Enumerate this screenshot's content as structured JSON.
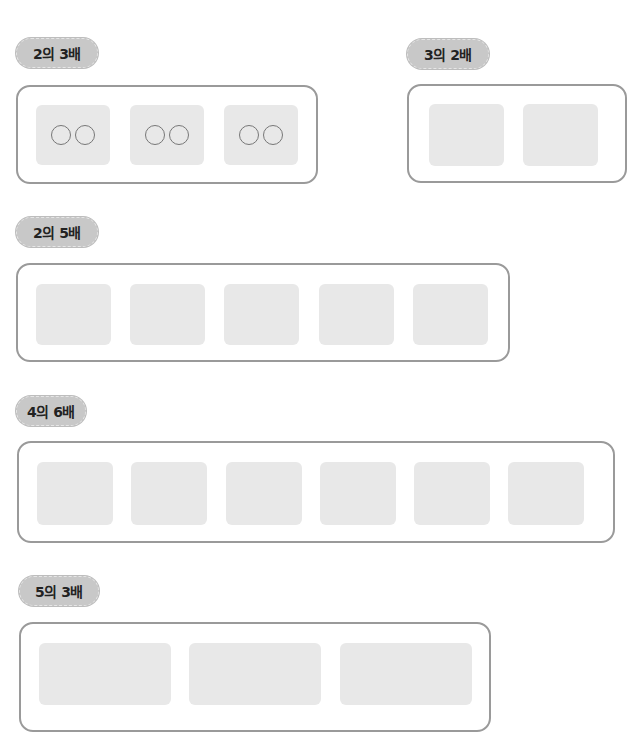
{
  "problems": [
    {
      "label": "2의 3배",
      "base": 2,
      "times": 3,
      "circles_per_cell": 2
    },
    {
      "label": "3의 2배",
      "base": 3,
      "times": 2,
      "circles_per_cell": 0
    },
    {
      "label": "2의 5배",
      "base": 2,
      "times": 5,
      "circles_per_cell": 0
    },
    {
      "label": "4의 6배",
      "base": 4,
      "times": 6,
      "circles_per_cell": 0
    },
    {
      "label": "5의 3배",
      "base": 5,
      "times": 3,
      "circles_per_cell": 0
    }
  ],
  "colors": {
    "pill_bg": "#c8c8c8",
    "cell_bg": "#e8e8e8",
    "border": "#9a9a9a"
  }
}
